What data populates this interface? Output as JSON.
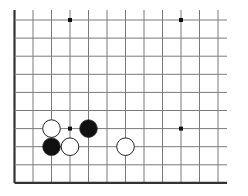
{
  "board": {
    "description": "Go board diagram (lower-left corner region)",
    "columns": 12,
    "rows": 10,
    "edges": {
      "left": "closed",
      "bottom": "closed",
      "top": "open",
      "right": "open"
    },
    "colors": {
      "background": "#ffffff",
      "grid_line": "#7a7a7a",
      "edge_line": "#333333",
      "black_stone": "#111111",
      "white_stone": "#ffffff",
      "stone_outline": "#222222",
      "star_point": "#111111"
    },
    "star_points": [
      {
        "col": 3,
        "row": 0
      },
      {
        "col": 9,
        "row": 0
      },
      {
        "col": 3,
        "row": 6
      },
      {
        "col": 9,
        "row": 6
      }
    ],
    "stones": [
      {
        "color": "white",
        "col": 2,
        "row": 6
      },
      {
        "color": "black",
        "col": 4,
        "row": 6
      },
      {
        "color": "black",
        "col": 2,
        "row": 7
      },
      {
        "color": "white",
        "col": 3,
        "row": 7
      },
      {
        "color": "white",
        "col": 6,
        "row": 7
      }
    ]
  }
}
